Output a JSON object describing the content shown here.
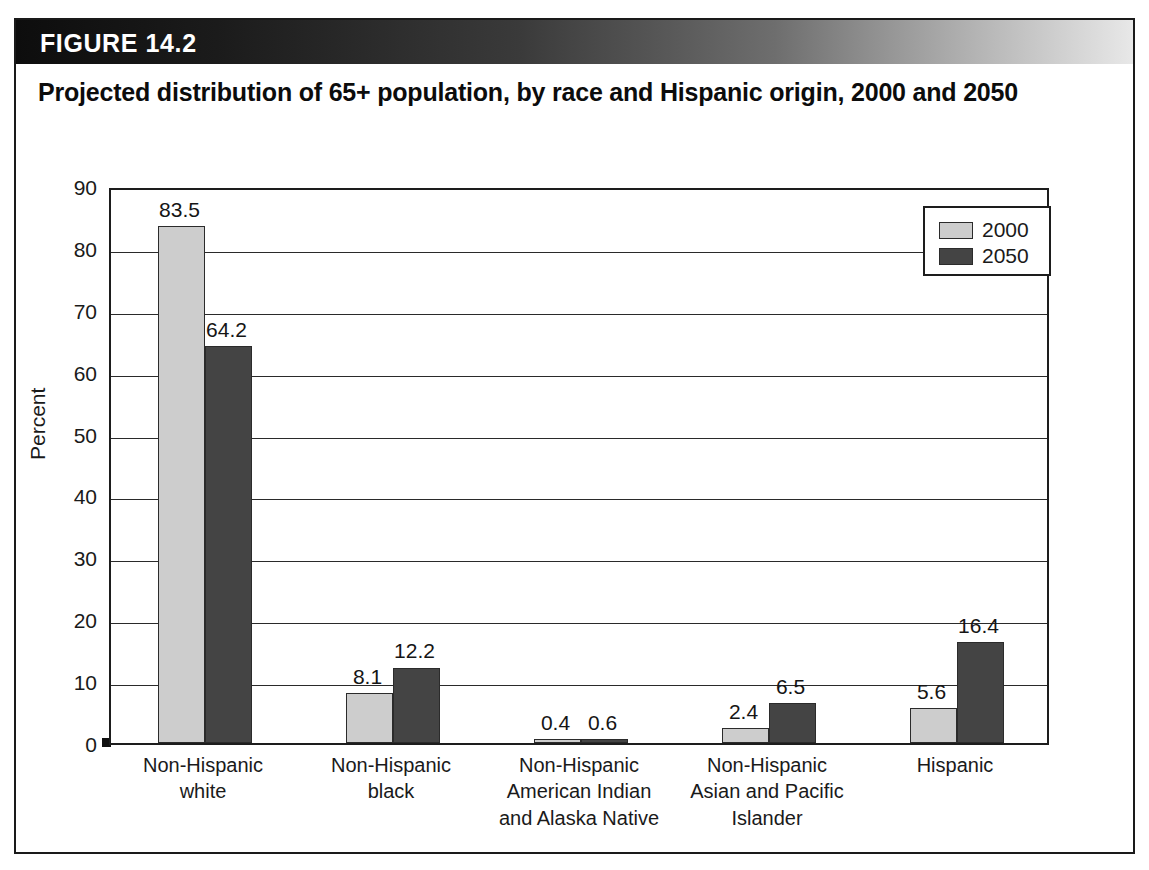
{
  "figure": {
    "number_label": "FIGURE 14.2",
    "title": "Projected distribution of 65+ population, by race and Hispanic origin, 2000 and 2050"
  },
  "chart_data": {
    "type": "bar",
    "title": "Projected distribution of 65+ population, by race and Hispanic origin, 2000 and 2050",
    "xlabel": "",
    "ylabel": "Percent",
    "ylim": [
      0,
      90
    ],
    "ytick_step": 10,
    "yticks": [
      0,
      10,
      20,
      30,
      40,
      50,
      60,
      70,
      80,
      90
    ],
    "ytick_labels": [
      "0",
      "10",
      "20",
      "30",
      "40",
      "50",
      "60",
      "70",
      "80",
      "90"
    ],
    "grid": true,
    "grid_axis": "y",
    "legend_position": "upper right",
    "categories": [
      "Non-Hispanic white",
      "Non-Hispanic black",
      "Non-Hispanic American Indian and Alaska Native",
      "Non-Hispanic Asian and Pacific Islander",
      "Hispanic"
    ],
    "category_labels": [
      "Non-Hispanic\nwhite",
      "Non-Hispanic\nblack",
      "Non-Hispanic\nAmerican Indian\nand Alaska Native",
      "Non-Hispanic\nAsian and Pacific\nIslander",
      "Hispanic"
    ],
    "series": [
      {
        "name": "2000",
        "color": "#cdcdcd",
        "values": [
          83.5,
          8.1,
          0.4,
          2.4,
          5.6
        ],
        "value_labels": [
          "83.5",
          "8.1",
          "0.4",
          "2.4",
          "5.6"
        ]
      },
      {
        "name": "2050",
        "color": "#444444",
        "values": [
          64.2,
          12.2,
          0.6,
          6.5,
          16.4
        ],
        "value_labels": [
          "64.2",
          "12.2",
          "0.6",
          "6.5",
          "16.4"
        ]
      }
    ]
  }
}
